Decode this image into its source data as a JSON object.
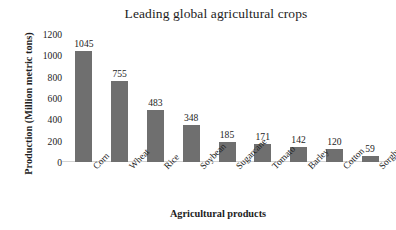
{
  "chart_data": {
    "type": "bar",
    "title": "Leading global agricultural crops",
    "xlabel": "Agricultural products",
    "ylabel": "Production (Million metric tons)",
    "categories": [
      "Corn",
      "Wheat",
      "Rice",
      "Soybean",
      "Sugarcane",
      "Tomato",
      "Barley",
      "Cotton",
      "Sorghum"
    ],
    "values": [
      1045,
      755,
      483,
      348,
      185,
      171,
      142,
      120,
      59
    ],
    "value_labels": [
      "1045",
      "755",
      "483",
      "348",
      "185",
      "171",
      "142",
      "120",
      "59"
    ],
    "ylim": [
      0,
      1200
    ],
    "yticks": [
      0,
      200,
      400,
      600,
      800,
      1000,
      1200
    ],
    "ytick_labels": [
      "0",
      "200",
      "400",
      "600",
      "800",
      "1000",
      "1200"
    ],
    "grid": false,
    "legend": false,
    "bar_color": "#6f6f6f",
    "background_color": "#ffffff",
    "axis_line_color": "#d3d3d3",
    "label_rotation": -45
  }
}
